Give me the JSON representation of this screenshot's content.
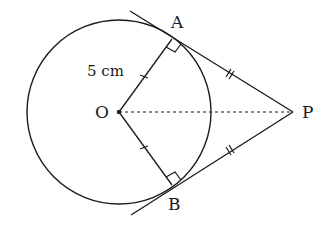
{
  "figure": {
    "points": {
      "O": {
        "label": "O"
      },
      "A": {
        "label": "A"
      },
      "B": {
        "label": "B"
      },
      "P": {
        "label": "P"
      }
    },
    "radius_label": "5 cm",
    "annotations": {
      "right_angle_at_A": true,
      "right_angle_at_B": true,
      "OA_equals_OB_tick": "single",
      "PA_equals_PB_tick": "double",
      "OP_line_style": "dotted"
    },
    "colors": {
      "stroke": "#1a1a1a",
      "background": "#ffffff"
    }
  }
}
